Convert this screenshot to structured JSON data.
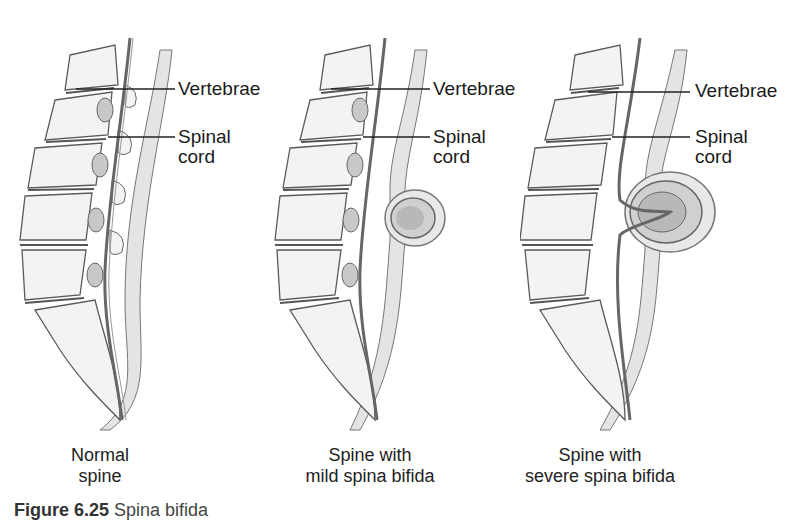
{
  "figure": {
    "number": "Figure 6.25",
    "title": "Spina bifida"
  },
  "labels": {
    "vertebrae": "Vertebrae",
    "spinal": "Spinal",
    "cord": "cord"
  },
  "panels": [
    {
      "caption_line1": "Normal",
      "caption_line2": "spine"
    },
    {
      "caption_line1": "Spine with",
      "caption_line2": "mild spina bifida"
    },
    {
      "caption_line1": "Spine with",
      "caption_line2": "severe spina bifida"
    }
  ],
  "colors": {
    "bone": "#f2f2f2",
    "outline": "#5a5a5a",
    "disc": "#9a9a9a",
    "tissue": "#dcdcdc",
    "sac": "#b5b5b5"
  }
}
